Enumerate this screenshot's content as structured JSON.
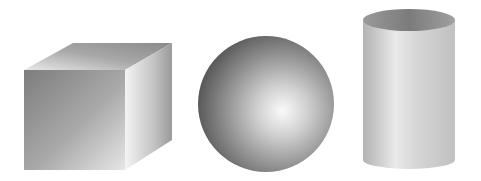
{
  "scene": {
    "background": "#ffffff",
    "shapes": [
      {
        "type": "cube",
        "label": "cube"
      },
      {
        "type": "sphere",
        "label": "sphere"
      },
      {
        "type": "cylinder",
        "label": "cylinder"
      }
    ]
  }
}
